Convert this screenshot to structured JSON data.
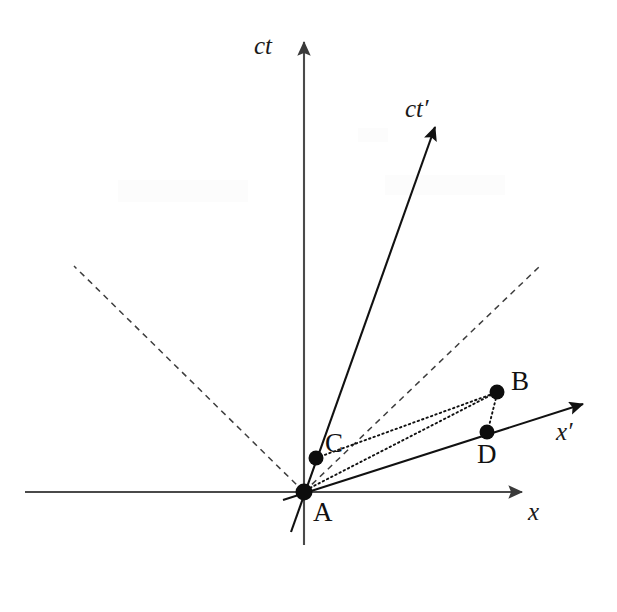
{
  "figure": {
    "width": 617,
    "height": 612,
    "background_color": "#ffffff"
  },
  "colors": {
    "axis": "#4a4a4a",
    "prime_axis": "#111111",
    "lightcone": "#3d3d3d",
    "dotted": "#111111",
    "dot": "#0d0d0d",
    "label": "#111111"
  },
  "axes": [
    {
      "id": "ct-axis",
      "label": "ct",
      "icon": "vertical-arrow-icon",
      "label_x": 272,
      "label_y": 54,
      "x1": 304,
      "y1": 545,
      "x2": 304,
      "y2": 42,
      "arrow": true,
      "style": "solid"
    },
    {
      "id": "x-axis",
      "label": "x",
      "icon": "horizontal-arrow-icon",
      "label_x": 528,
      "label_y": 520,
      "x1": 25,
      "y1": 492,
      "x2": 522,
      "y2": 492,
      "arrow": true,
      "style": "solid"
    },
    {
      "id": "ct-prime-axis",
      "label": "ct′",
      "icon": "diagonal-arrow-icon",
      "label_x": 405,
      "label_y": 117,
      "x1": 291,
      "y1": 532,
      "x2": 437,
      "y2": 124,
      "arrow": true,
      "style": "solid"
    },
    {
      "id": "x-prime-axis",
      "label": "x′",
      "icon": "diagonal-arrow-icon",
      "label_x": 556,
      "label_y": 440,
      "x1": 283,
      "y1": 500,
      "x2": 586,
      "y2": 403,
      "arrow": true,
      "style": "solid"
    }
  ],
  "lightcone": [
    {
      "id": "lightcone-left",
      "x1": 304,
      "y1": 492,
      "x2": 74,
      "y2": 266
    },
    {
      "id": "lightcone-right",
      "x1": 304,
      "y1": 492,
      "x2": 540,
      "y2": 266
    }
  ],
  "events": [
    {
      "id": "event-a",
      "label": "A",
      "x": 304,
      "y": 492,
      "r": 8.5,
      "label_x": 313,
      "label_y": 520
    },
    {
      "id": "event-b",
      "label": "B",
      "x": 497,
      "y": 392,
      "r": 7.5,
      "label_x": 510,
      "label_y": 388
    },
    {
      "id": "event-c",
      "label": "C",
      "x": 316,
      "y": 458,
      "r": 7.5,
      "label_x": 325,
      "label_y": 450
    },
    {
      "id": "event-d",
      "label": "D",
      "x": 487,
      "y": 432,
      "r": 7.5,
      "label_x": 478,
      "label_y": 462
    }
  ],
  "connectors": [
    {
      "id": "connector-c-to-b",
      "from": "C",
      "to": "B",
      "x1": 316,
      "y1": 458,
      "x2": 497,
      "y2": 392,
      "style": "dotted"
    },
    {
      "id": "connector-b-to-d",
      "from": "B",
      "to": "D",
      "x1": 497,
      "y1": 392,
      "x2": 487,
      "y2": 432,
      "style": "dotted"
    },
    {
      "id": "connector-a-to-b",
      "from": "A",
      "to": "B",
      "x1": 306,
      "y1": 490,
      "x2": 497,
      "y2": 392,
      "style": "dotted"
    }
  ]
}
